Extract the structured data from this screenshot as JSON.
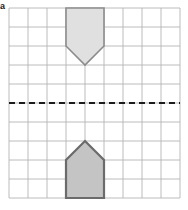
{
  "figure": {
    "part_label": "a",
    "caption": "",
    "type": "reflection-grid"
  },
  "grid": {
    "columns": 9,
    "rows": 10,
    "cell_size": 19,
    "origin_x": 9,
    "origin_y": 8,
    "line_color": "#b4b4b4",
    "line_width": 0.9,
    "border_color": "#b0b0b0"
  },
  "mirror_line": {
    "name": "mirror-line",
    "orientation": "horizontal",
    "y": 103,
    "x_start": 9,
    "x_end": 180,
    "color": "#1c1c1c",
    "width": 2,
    "dash": "6 4"
  },
  "shapes": [
    {
      "name": "pentagon-image-top",
      "role": "image",
      "description": "pentagon pointing down",
      "points": "66,8 104,8 104,46 85,65 66,46",
      "fill": "#e0e0e0",
      "stroke": "#8c8c8c",
      "stroke_width": 1.6
    },
    {
      "name": "pentagon-object-bottom",
      "role": "object",
      "description": "pentagon pointing up",
      "points": "85,141 104,160 104,198 66,198 66,160",
      "fill": "#c4c4c4",
      "stroke": "#6b6b6b",
      "stroke_width": 2.2
    }
  ],
  "colors": {
    "background": "#ffffff",
    "grid": "#b4b4b4",
    "mirror": "#1c1c1c",
    "shape_light_fill": "#e0e0e0",
    "shape_dark_fill": "#c4c4c4"
  }
}
